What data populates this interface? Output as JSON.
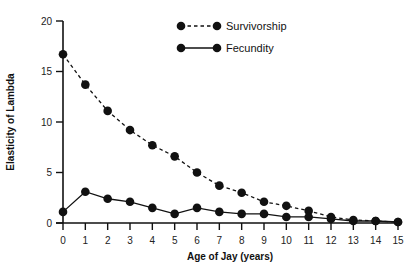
{
  "chart_data": {
    "type": "line",
    "title": "",
    "xlabel": "Age of Jay (years)",
    "ylabel": "Elasticity of Lambda",
    "x": [
      0,
      1,
      2,
      3,
      4,
      5,
      6,
      7,
      8,
      9,
      10,
      11,
      12,
      13,
      14,
      15
    ],
    "xticks": [
      "0",
      "1",
      "2",
      "3",
      "4",
      "5",
      "6",
      "7",
      "8",
      "9",
      "10",
      "11",
      "12",
      "13",
      "14",
      "15"
    ],
    "yticks": [
      "0",
      "5",
      "10",
      "15",
      "20"
    ],
    "xlim": [
      0,
      15
    ],
    "ylim": [
      0,
      20
    ],
    "grid": false,
    "legend_position": "upper right",
    "series": [
      {
        "name": "Survivorship",
        "line_style": "dashed",
        "marker": "filled-circle",
        "color": "#111111",
        "values": [
          16.7,
          13.7,
          11.1,
          9.2,
          7.7,
          6.6,
          5.0,
          3.7,
          3.0,
          2.1,
          1.7,
          1.2,
          0.6,
          0.3,
          0.2,
          0.1
        ]
      },
      {
        "name": "Fecundity",
        "line_style": "solid",
        "marker": "filled-circle",
        "color": "#111111",
        "values": [
          1.1,
          3.1,
          2.4,
          2.1,
          1.5,
          0.9,
          1.5,
          1.1,
          0.9,
          0.9,
          0.6,
          0.6,
          0.4,
          0.2,
          0.2,
          0.1
        ]
      }
    ]
  }
}
